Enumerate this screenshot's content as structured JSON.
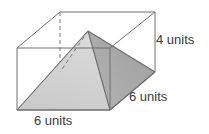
{
  "figure": {
    "shape_names": {
      "prism": "rectangular-prism",
      "pyramid": "inscribed-pyramid"
    },
    "labels": {
      "height": "4 units",
      "depth": "6 units",
      "width": "6 units"
    },
    "measurements": [
      {
        "name": "height",
        "value": 4,
        "unit": "units"
      },
      {
        "name": "depth",
        "value": 6,
        "unit": "units"
      },
      {
        "name": "width",
        "value": 6,
        "unit": "units"
      }
    ],
    "colors": {
      "background": "#ffffff",
      "outline": "#6e6e6e",
      "hidden_edge": "#7a7a7a",
      "pyramid_light": "#d6d6d6",
      "pyramid_mid": "#c2c2c2",
      "pyramid_dark": "#a8a8a8",
      "label_text": "#3a3a3a"
    },
    "geometry": {
      "prism_vertices": {
        "front_bottom_left": [
          17,
          110
        ],
        "front_bottom_right": [
          110,
          110
        ],
        "front_top_left": [
          17,
          48
        ],
        "front_top_right": [
          110,
          48
        ],
        "back_bottom_left": [
          60,
          72
        ],
        "back_bottom_right": [
          155,
          72
        ],
        "back_top_left": [
          60,
          12
        ],
        "back_top_right": [
          155,
          12
        ]
      },
      "pyramid_vertices": {
        "apex": [
          88,
          31
        ],
        "base_front_left": [
          17,
          110
        ],
        "base_front_right": [
          110,
          110
        ],
        "base_back_left": [
          60,
          72
        ],
        "base_back_right": [
          155,
          72
        ]
      }
    }
  }
}
